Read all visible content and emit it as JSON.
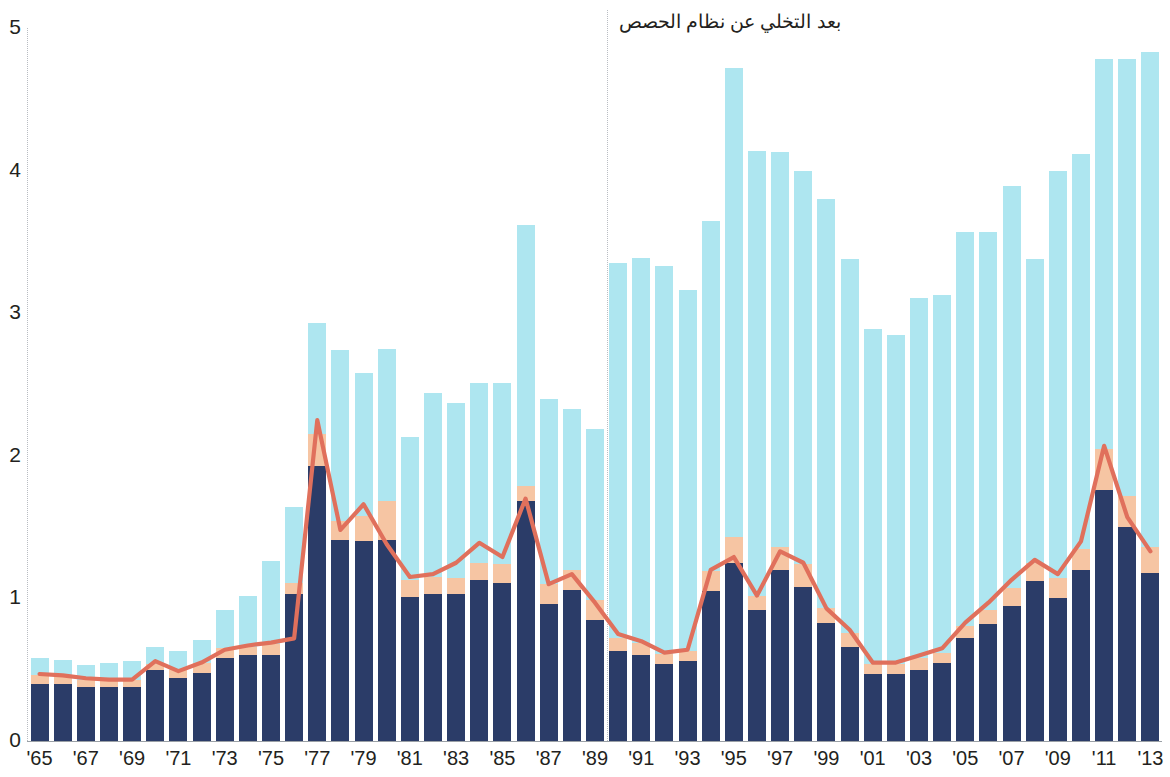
{
  "chart_data": {
    "type": "bar",
    "title": "",
    "subtitle": "",
    "xlabel": "",
    "ylabel": "",
    "ylim": [
      0,
      5
    ],
    "xlim": [
      "1965",
      "2013"
    ],
    "grid": false,
    "legend_position": "none",
    "y_ticks": [
      "0",
      "1",
      "2",
      "3",
      "4",
      "5"
    ],
    "y_tick_values": [
      0,
      1,
      2,
      3,
      4,
      5
    ],
    "x_tick_labels": [
      "'65",
      "'67",
      "'69",
      "'71",
      "'73",
      "'75",
      "'77",
      "'79",
      "'81",
      "'83",
      "'85",
      "'87",
      "'89",
      "'91",
      "'93",
      "'95",
      "'97",
      "'99",
      "'01",
      "'03",
      "'05",
      "'07",
      "'09",
      "'11",
      "'13"
    ],
    "x_tick_years": [
      1965,
      1967,
      1969,
      1971,
      1973,
      1975,
      1977,
      1979,
      1981,
      1983,
      1985,
      1987,
      1989,
      1991,
      1993,
      1995,
      1997,
      1999,
      2001,
      2003,
      2005,
      2007,
      2009,
      2011,
      2013
    ],
    "categories": [
      1965,
      1966,
      1967,
      1968,
      1969,
      1970,
      1971,
      1972,
      1973,
      1974,
      1975,
      1976,
      1977,
      1978,
      1979,
      1980,
      1981,
      1982,
      1983,
      1984,
      1985,
      1986,
      1987,
      1988,
      1989,
      1990,
      1991,
      1992,
      1993,
      1994,
      1995,
      1996,
      1997,
      1998,
      1999,
      2000,
      2001,
      2002,
      2003,
      2004,
      2005,
      2006,
      2007,
      2008,
      2009,
      2010,
      2011,
      2012,
      2013
    ],
    "stack_order": [
      "navy",
      "peach",
      "cyan"
    ],
    "series": [
      {
        "name": "navy",
        "color": "#2b3c68",
        "values": [
          0.4,
          0.4,
          0.38,
          0.38,
          0.38,
          0.5,
          0.44,
          0.48,
          0.58,
          0.6,
          0.6,
          1.03,
          1.93,
          1.41,
          1.4,
          1.41,
          1.01,
          1.03,
          1.03,
          1.13,
          1.11,
          1.68,
          0.96,
          1.06,
          0.85,
          0.63,
          0.6,
          0.54,
          0.56,
          1.05,
          1.25,
          0.92,
          1.2,
          1.08,
          0.83,
          0.66,
          0.47,
          0.47,
          0.5,
          0.55,
          0.72,
          0.82,
          0.95,
          1.12,
          1.0,
          1.2,
          1.76,
          1.5,
          1.18
        ]
      },
      {
        "name": "peach",
        "color": "#f6c5a3",
        "values": [
          0.06,
          0.05,
          0.05,
          0.05,
          0.05,
          0.04,
          0.06,
          0.07,
          0.07,
          0.06,
          0.08,
          0.08,
          0.22,
          0.13,
          0.18,
          0.27,
          0.12,
          0.12,
          0.11,
          0.12,
          0.13,
          0.11,
          0.14,
          0.14,
          0.14,
          0.09,
          0.09,
          0.07,
          0.07,
          0.14,
          0.18,
          0.1,
          0.16,
          0.16,
          0.1,
          0.1,
          0.07,
          0.07,
          0.08,
          0.07,
          0.09,
          0.1,
          0.12,
          0.13,
          0.14,
          0.15,
          0.29,
          0.22,
          0.18
        ]
      },
      {
        "name": "cyan",
        "color": "#aee6f0",
        "values": [
          0.12,
          0.12,
          0.1,
          0.12,
          0.13,
          0.12,
          0.13,
          0.16,
          0.27,
          0.36,
          0.58,
          0.53,
          0.78,
          1.2,
          1.0,
          1.07,
          1.0,
          1.29,
          1.23,
          1.26,
          1.27,
          1.83,
          1.3,
          1.13,
          1.2,
          2.63,
          2.7,
          2.72,
          2.53,
          2.46,
          3.29,
          3.12,
          2.77,
          2.76,
          2.87,
          2.62,
          2.35,
          2.31,
          2.53,
          2.51,
          2.76,
          2.65,
          2.82,
          2.13,
          2.86,
          2.77,
          2.73,
          3.06,
          3.47
        ]
      }
    ],
    "totals": [
      0.58,
      0.57,
      0.53,
      0.55,
      0.56,
      0.66,
      0.63,
      0.71,
      0.92,
      1.02,
      1.26,
      1.64,
      2.93,
      2.74,
      2.58,
      2.75,
      2.13,
      2.44,
      2.37,
      2.51,
      2.51,
      3.62,
      3.4,
      2.33,
      2.19,
      3.35,
      3.39,
      3.33,
      3.16,
      3.65,
      4.72,
      4.14,
      4.13,
      4.0,
      3.8,
      3.38,
      2.89,
      2.85,
      3.11,
      3.13,
      3.57,
      3.57,
      3.89,
      3.38,
      4.0,
      4.12,
      4.78,
      4.78,
      4.83
    ],
    "line": {
      "name": "trend-line",
      "color": "#e0705c",
      "values": [
        0.47,
        0.46,
        0.44,
        0.43,
        0.43,
        0.56,
        0.49,
        0.55,
        0.64,
        0.67,
        0.69,
        0.72,
        2.25,
        1.48,
        1.66,
        1.38,
        1.15,
        1.17,
        1.25,
        1.39,
        1.29,
        1.7,
        1.1,
        1.17,
        0.97,
        0.75,
        0.7,
        0.62,
        0.64,
        1.2,
        1.29,
        1.02,
        1.33,
        1.25,
        0.93,
        0.78,
        0.55,
        0.55,
        0.6,
        0.65,
        0.83,
        0.97,
        1.13,
        1.27,
        1.17,
        1.4,
        2.07,
        1.57,
        1.33
      ]
    },
    "annotations": [
      {
        "id": "quota-system-note",
        "text": "بعد التخلي عن نظام الحصص",
        "x_year": 1990,
        "y": 5.0,
        "divider_year": 1989.5,
        "divider": true
      }
    ],
    "colors": {
      "navy": "#2b3c68",
      "peach": "#f6c5a3",
      "cyan": "#aee6f0",
      "line": "#e0705c",
      "axis": "#9aa0a6",
      "text": "#231f20",
      "background": "#ffffff"
    }
  }
}
